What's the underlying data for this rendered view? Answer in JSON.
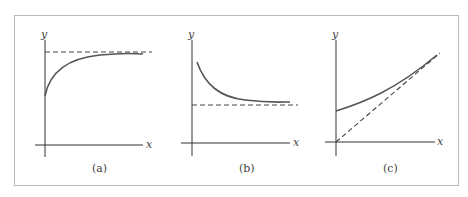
{
  "figure": {
    "frame_color": "#b9b9b9",
    "axis_color": "#333333",
    "curve_color": "#555555",
    "dash_color": "#444444",
    "panels": [
      {
        "caption": "(a)",
        "x_label": "x",
        "y_label": "y",
        "description": "Increasing concave curve starting above origin, approaching a horizontal dashed asymptote from below"
      },
      {
        "caption": "(b)",
        "x_label": "x",
        "y_label": "y",
        "description": "Decreasing convex curve approaching a horizontal dashed asymptote from above"
      },
      {
        "caption": "(c)",
        "x_label": "x",
        "y_label": "y",
        "description": "Increasing curve starting above origin, approaching a dashed oblique asymptote through the origin"
      }
    ]
  }
}
